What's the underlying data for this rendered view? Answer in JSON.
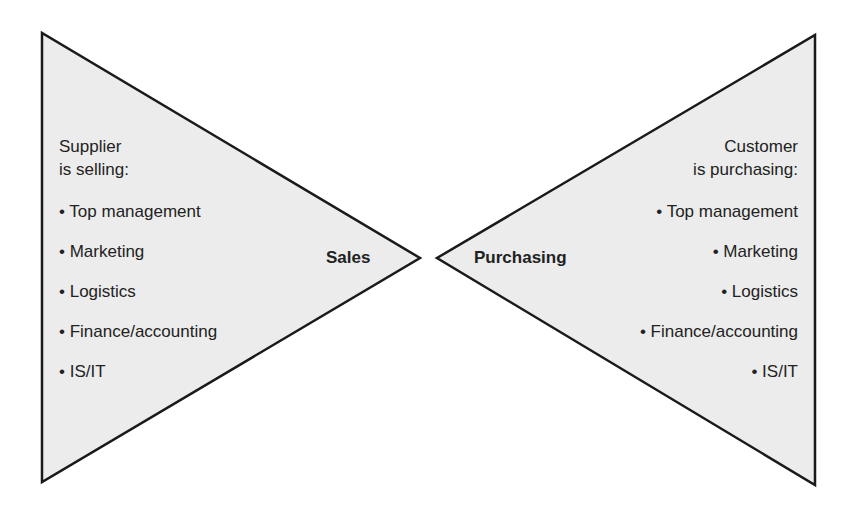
{
  "left": {
    "heading_line1": "Supplier",
    "heading_line2": "is selling:",
    "label": "Sales",
    "items": [
      "• Top management",
      "• Marketing",
      "• Logistics",
      "• Finance/accounting",
      "• IS/IT"
    ]
  },
  "right": {
    "heading_line1": "Customer",
    "heading_line2": "is purchasing:",
    "label": "Purchasing",
    "items": [
      "• Top management",
      "• Marketing",
      "• Logistics",
      "• Finance/accounting",
      "• IS/IT"
    ]
  },
  "colors": {
    "fill": "#ececec",
    "stroke": "#1a1a1a"
  }
}
